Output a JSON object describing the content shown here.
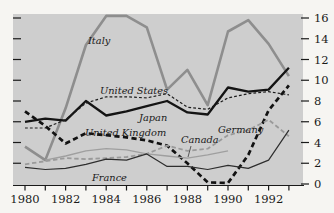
{
  "figure": {
    "page_background": "#f6f5f2",
    "plot_background": "#cecece",
    "axis_color": "#1a1a1a",
    "tick_label_color": "#1a1a1a"
  },
  "chart_data": {
    "type": "line",
    "title": "",
    "xlabel": "",
    "ylabel": "",
    "x": [
      1980,
      1981,
      1982,
      1983,
      1984,
      1985,
      1986,
      1987,
      1988,
      1989,
      1990,
      1991,
      1992,
      1993
    ],
    "x_tick_labels": [
      "1980",
      "1982",
      "1984",
      "1986",
      "1988",
      "1990",
      "1992"
    ],
    "x_labeled_years": [
      1980,
      1982,
      1984,
      1986,
      1988,
      1990,
      1992
    ],
    "xlim": [
      1979.4,
      1993.7
    ],
    "ylim": [
      0,
      16
    ],
    "y_ticks": [
      0,
      2,
      4,
      6,
      8,
      10,
      12,
      14,
      16
    ],
    "y_tick_label_side": "right",
    "grid": false,
    "legend_position": "inline-labels",
    "series": [
      {
        "name": "Italy",
        "color": "#8e8e8e",
        "style": "solid",
        "width": 2.6,
        "values": [
          3.6,
          2.3,
          7.3,
          13.4,
          16.2,
          16.2,
          15.1,
          9.1,
          11.0,
          7.6,
          14.7,
          15.8,
          13.5,
          10.4
        ]
      },
      {
        "name": "Japan",
        "color": "#141414",
        "style": "solid",
        "width": 2.3,
        "values": [
          6.0,
          6.3,
          6.1,
          8.0,
          6.6,
          7.0,
          7.5,
          8.0,
          6.9,
          6.7,
          9.3,
          8.9,
          9.1,
          11.2
        ]
      },
      {
        "name": "United States",
        "color": "#1c1c1c",
        "style": "dashed-fine",
        "width": 1.2,
        "values": [
          5.4,
          5.4,
          6.2,
          7.8,
          8.4,
          8.4,
          8.3,
          8.7,
          7.4,
          7.2,
          8.3,
          8.7,
          8.9,
          8.6
        ]
      },
      {
        "name": "United Kingdom",
        "color": "#121212",
        "style": "dashed-heavy",
        "width": 2.7,
        "values": [
          7.0,
          5.6,
          3.9,
          4.9,
          4.7,
          4.5,
          4.2,
          3.7,
          2.0,
          0.15,
          0.1,
          2.8,
          7.1,
          9.5
        ]
      },
      {
        "name": "Germany",
        "color": "#9a9a9a",
        "style": "dashed",
        "width": 1.8,
        "values": [
          1.9,
          2.2,
          2.5,
          2.4,
          2.5,
          2.6,
          2.9,
          3.7,
          3.2,
          3.4,
          4.7,
          5.2,
          6.2,
          4.6
        ]
      },
      {
        "name": "Canada",
        "color": "#9f9f9f",
        "style": "solid",
        "width": 1.3,
        "values": [
          null,
          2.3,
          2.7,
          3.2,
          3.4,
          3.3,
          2.9,
          2.7,
          2.5,
          2.8,
          3.2,
          null,
          null,
          null
        ]
      },
      {
        "name": "France",
        "color": "#2e2e2e",
        "style": "solid",
        "width": 1.2,
        "values": [
          1.6,
          1.4,
          1.5,
          1.9,
          2.4,
          2.3,
          2.9,
          1.7,
          1.7,
          1.4,
          1.8,
          1.5,
          2.3,
          5.2
        ]
      }
    ],
    "annotations": [
      {
        "text": "Italy",
        "x": 88,
        "y": 44
      },
      {
        "text": "United States",
        "x": 100,
        "y": 94
      },
      {
        "text": "Japan",
        "x": 139,
        "y": 121
      },
      {
        "text": "United Kingdom",
        "x": 85,
        "y": 136
      },
      {
        "text": "Canada",
        "x": 181,
        "y": 143,
        "pointer": {
          "x1": 191,
          "y1": 146,
          "x2": 188,
          "y2": 157
        }
      },
      {
        "text": "Germany",
        "x": 218,
        "y": 133
      },
      {
        "text": "France",
        "x": 92,
        "y": 181
      }
    ]
  }
}
